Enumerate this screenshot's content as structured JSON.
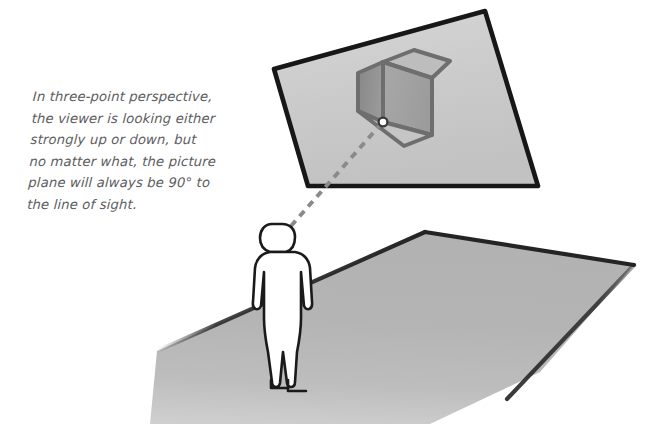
{
  "figure": {
    "caption": "In three-point perspective,\nthe viewer is looking either\nstrongly up or down, but\nno matter what, the picture\nplane will always be 90° to\nthe line of sight.",
    "caption_lines": [
      "In three-point perspective,",
      "the viewer is looking either",
      "strongly up or down, but",
      "no matter what, the picture",
      "plane will always be 90° to",
      "the line of sight."
    ],
    "angle_label": "90°"
  },
  "colors": {
    "background": "#ffffff",
    "caption_text": "#5c5c60",
    "picture_plane_fill": "#c8c8c8",
    "picture_plane_fill_light": "#d2d2d2",
    "picture_plane_outline": "#1a1a1a",
    "ground_plane_fill": "#b4b4b4",
    "ground_plane_outline": "#242424",
    "cube_face_left": "#8e8e8e",
    "cube_face_right": "#a3a3a3",
    "cube_face_top": "#b5b5b5",
    "cube_edge": "#6e6e6e",
    "figure_fill": "#ffffff",
    "figure_outline": "#1a1a1a",
    "sight_line": "#8a8a8e",
    "eye_point_fill": "#ffffff",
    "eye_point_outline": "#3a3a3a"
  },
  "elements": {
    "picture_plane_name": "picture-plane",
    "ground_plane_name": "ground-plane",
    "cube_name": "cube",
    "viewer_name": "viewer-figure",
    "sight_line_name": "line-of-sight",
    "eye_point_name": "eye-point-marker"
  },
  "geometry": {
    "picture_plane_points": "274,69 485,11 538,186 308,186",
    "ground_plane_points": "425,232 634,265 505,400 300,395 157,351",
    "cube": {
      "top_face": "383,62 414,50 449,60 418,74",
      "left_face": "358,72 383,62 383,122 358,110",
      "right_face": "383,62 432,78 432,135 383,122",
      "front_bottom": "358,110 383,122 432,135 400,145"
    },
    "sight_line_start": "291,226",
    "sight_line_end": "383,122",
    "eye_point": {
      "cx": 383,
      "cy": 122,
      "r": 4.4
    }
  }
}
